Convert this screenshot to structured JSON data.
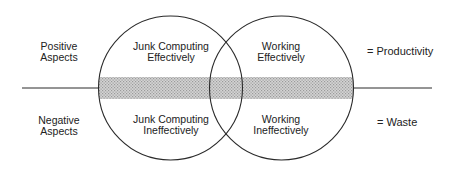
{
  "diagram": {
    "type": "venn",
    "row_labels": {
      "positive": {
        "line1": "Positive",
        "line2": "Aspects"
      },
      "negative": {
        "line1": "Negative",
        "line2": "Aspects"
      }
    },
    "circles": {
      "left": {
        "top": {
          "line1": "Junk Computing",
          "line2": "Effectively"
        },
        "bottom": {
          "line1": "Junk Computing",
          "line2": "Ineffectively"
        }
      },
      "right": {
        "top": {
          "line1": "Working",
          "line2": "Effectively"
        },
        "bottom": {
          "line1": "Working",
          "line2": "Ineffectively"
        }
      }
    },
    "outcomes": {
      "positive": "= Productivity",
      "negative": "= Waste"
    },
    "colors": {
      "stroke": "#2a2a2a",
      "band": "#bdbdbd",
      "background": "#ffffff"
    }
  }
}
